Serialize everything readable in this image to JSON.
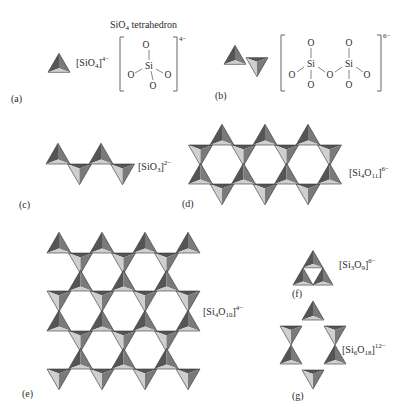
{
  "colors": {
    "face_dark": "#555555",
    "face_mid": "#7a7a7a",
    "face_light": "#cfcfcf",
    "text": "#2a2a2a"
  },
  "panels": {
    "a": {
      "label": "(a)",
      "heading": "SiO4 tetrahedron",
      "heading_main": "SiO",
      "heading_sub": "4",
      "heading_rest": " tetrahedron",
      "formula": {
        "prefix": "[SiO",
        "sub": "4",
        "close": "]",
        "charge": "4−"
      },
      "structure": {
        "center": "Si",
        "oxygens": [
          "O",
          "O",
          "O",
          "O"
        ],
        "charge": "4−"
      }
    },
    "b": {
      "label": "(b)",
      "structure": {
        "si": [
          "Si",
          "Si"
        ],
        "oxygens": [
          "O",
          "O",
          "O",
          "O",
          "O",
          "O",
          "O"
        ],
        "charge": "6−"
      }
    },
    "c": {
      "label": "(c)",
      "formula": {
        "prefix": "[SiO",
        "sub": "3",
        "close": "]",
        "charge": "2−"
      },
      "description": "single chain"
    },
    "d": {
      "label": "(d)",
      "formula": {
        "prefix": "[Si",
        "sub1": "4",
        "mid": "O",
        "sub2": "11",
        "close": "]",
        "charge": "6−"
      },
      "description": "double chain"
    },
    "e": {
      "label": "(e)",
      "formula": {
        "prefix": "[Si",
        "sub1": "4",
        "mid": "O",
        "sub2": "10",
        "close": "]",
        "charge": "4−"
      },
      "description": "sheet"
    },
    "f": {
      "label": "(f)",
      "formula": {
        "prefix": "[Si",
        "sub1": "3",
        "mid": "O",
        "sub2": "9",
        "close": "]",
        "charge": "6−"
      },
      "description": "three-membered ring"
    },
    "g": {
      "label": "(g)",
      "formula": {
        "prefix": "[Si",
        "sub1": "6",
        "mid": "O",
        "sub2": "18",
        "close": "]",
        "charge": "12−"
      },
      "description": "six-membered ring"
    }
  }
}
